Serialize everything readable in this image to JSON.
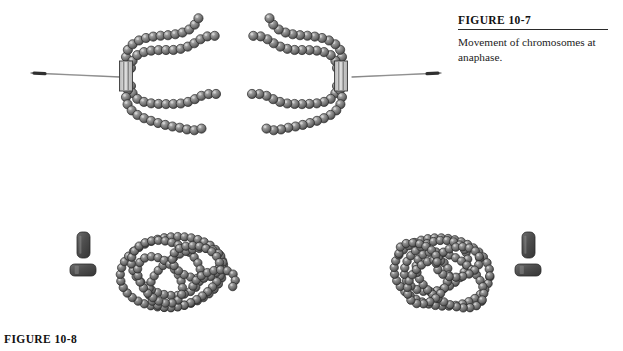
{
  "figure_top": {
    "label": "FIGURE 10-7",
    "caption": "Movement of chromosomes at anaphase."
  },
  "figure_bottom": {
    "label": "FIGURE 10-8"
  },
  "colors": {
    "background": "#ffffff",
    "bead_fill": "#7d7d7d",
    "bead_fill_light": "#a8a8a8",
    "bead_fill_dark": "#4a4a4a",
    "bead_outline": "#2b2b2b",
    "bead_highlight": "#d9d9d9",
    "spindle_fiber": "#8c8c8c",
    "spindle_fiber_tip": "#303030",
    "centromere_fill": "#c9c9c9",
    "centromere_stroke": "#3a3a3a",
    "centriole_fill": "#555555",
    "centriole_stroke": "#2a2a2a",
    "text": "#111111",
    "rule": "#2a2a2a"
  },
  "geometry": {
    "canvas": {
      "width": 623,
      "height": 351
    },
    "bead_radius": 4.6,
    "bead_spacing": 7.4,
    "chromatin_bead_radius": 4.2,
    "chromatin_bead_spacing": 6.8
  },
  "anaphase_scene": {
    "name": "anaphase-chromosomes",
    "left_chromosome": {
      "name": "left-chromosome",
      "centromere": {
        "x": 126,
        "y": 76,
        "width": 13,
        "height": 30,
        "bars": 3
      },
      "arms": [
        {
          "name": "upper-outer-arm",
          "points": [
            [
              128,
              64
            ],
            [
              126,
              56
            ],
            [
              129,
              48
            ],
            [
              136,
              42
            ],
            [
              146,
              38
            ],
            [
              158,
              36
            ],
            [
              170,
              35
            ],
            [
              181,
              33
            ],
            [
              190,
              29
            ],
            [
              196,
              23
            ],
            [
              199,
              17
            ]
          ]
        },
        {
          "name": "upper-inner-arm",
          "points": [
            [
              131,
              68
            ],
            [
              133,
              60
            ],
            [
              139,
              54
            ],
            [
              149,
              51
            ],
            [
              161,
              50
            ],
            [
              173,
              50
            ],
            [
              184,
              48
            ],
            [
              193,
              44
            ],
            [
              201,
              39
            ],
            [
              209,
              36
            ],
            [
              217,
              36
            ]
          ]
        },
        {
          "name": "lower-inner-arm",
          "points": [
            [
              131,
              86
            ],
            [
              133,
              94
            ],
            [
              139,
              100
            ],
            [
              149,
              103
            ],
            [
              161,
              104
            ],
            [
              173,
              104
            ],
            [
              184,
              103
            ],
            [
              193,
              100
            ],
            [
              201,
              96
            ],
            [
              209,
              94
            ],
            [
              217,
              94
            ]
          ]
        },
        {
          "name": "lower-outer-arm",
          "points": [
            [
              128,
              90
            ],
            [
              126,
              98
            ],
            [
              129,
              107
            ],
            [
              136,
              114
            ],
            [
              146,
              119
            ],
            [
              158,
              123
            ],
            [
              170,
              126
            ],
            [
              181,
              128
            ],
            [
              190,
              130
            ],
            [
              197,
              130
            ],
            [
              203,
              128
            ]
          ]
        }
      ],
      "spindle_fiber": {
        "name": "left-spindle-fiber",
        "from": [
          31,
          73
        ],
        "to": [
          120,
          77
        ],
        "tip_at": "from"
      }
    },
    "right_chromosome": {
      "name": "right-chromosome",
      "centromere": {
        "x": 341,
        "y": 76,
        "width": 13,
        "height": 30,
        "bars": 3
      },
      "arms": [
        {
          "name": "upper-outer-arm",
          "points": [
            [
              340,
              64
            ],
            [
              342,
              56
            ],
            [
              339,
              48
            ],
            [
              332,
              42
            ],
            [
              322,
              38
            ],
            [
              310,
              36
            ],
            [
              298,
              35
            ],
            [
              287,
              33
            ],
            [
              278,
              29
            ],
            [
              272,
              23
            ],
            [
              269,
              17
            ]
          ]
        },
        {
          "name": "upper-inner-arm",
          "points": [
            [
              337,
              68
            ],
            [
              335,
              60
            ],
            [
              329,
              54
            ],
            [
              319,
              51
            ],
            [
              307,
              50
            ],
            [
              295,
              50
            ],
            [
              284,
              48
            ],
            [
              275,
              44
            ],
            [
              267,
              39
            ],
            [
              259,
              36
            ],
            [
              251,
              36
            ]
          ]
        },
        {
          "name": "lower-inner-arm",
          "points": [
            [
              337,
              86
            ],
            [
              335,
              94
            ],
            [
              329,
              100
            ],
            [
              319,
              103
            ],
            [
              307,
              104
            ],
            [
              295,
              104
            ],
            [
              284,
              103
            ],
            [
              275,
              100
            ],
            [
              267,
              96
            ],
            [
              259,
              94
            ],
            [
              251,
              94
            ]
          ]
        },
        {
          "name": "lower-outer-arm",
          "points": [
            [
              340,
              90
            ],
            [
              342,
              98
            ],
            [
              339,
              107
            ],
            [
              332,
              114
            ],
            [
              322,
              119
            ],
            [
              310,
              123
            ],
            [
              298,
              126
            ],
            [
              287,
              128
            ],
            [
              278,
              130
            ],
            [
              271,
              130
            ],
            [
              265,
              128
            ]
          ]
        }
      ],
      "spindle_fiber": {
        "name": "right-spindle-fiber",
        "from": [
          441,
          73
        ],
        "to": [
          352,
          77
        ],
        "tip_at": "from"
      }
    }
  },
  "telophase_scene": {
    "name": "telophase-chromatin",
    "left_chromatin": {
      "name": "left-chromatin-mass",
      "center": [
        175,
        272
      ],
      "loops": [
        {
          "name": "chromatin-loop-1",
          "cx": 172,
          "cy": 272,
          "rx": 52,
          "ry": 35,
          "rot": -8,
          "start": 0,
          "sweep": 360
        },
        {
          "name": "chromatin-loop-2",
          "cx": 166,
          "cy": 268,
          "rx": 36,
          "ry": 26,
          "rot": 22,
          "start": 0,
          "sweep": 360
        },
        {
          "name": "chromatin-loop-3",
          "cx": 186,
          "cy": 278,
          "rx": 41,
          "ry": 24,
          "rot": -32,
          "start": 0,
          "sweep": 360
        },
        {
          "name": "chromatin-loop-4",
          "cx": 160,
          "cy": 280,
          "rx": 27,
          "ry": 18,
          "rot": 48,
          "start": 0,
          "sweep": 360
        },
        {
          "name": "chromatin-loop-5",
          "cx": 196,
          "cy": 262,
          "rx": 24,
          "ry": 16,
          "rot": 12,
          "start": 0,
          "sweep": 360
        },
        {
          "name": "chromatin-tail-1",
          "cx": 214,
          "cy": 284,
          "rx": 22,
          "ry": 13,
          "rot": -18,
          "start": 200,
          "sweep": 200
        }
      ]
    },
    "right_chromatin": {
      "name": "right-chromatin-mass",
      "center": [
        442,
        272
      ],
      "loops": [
        {
          "name": "chromatin-loop-1",
          "cx": 442,
          "cy": 272,
          "rx": 48,
          "ry": 34,
          "rot": 6,
          "start": 0,
          "sweep": 360
        },
        {
          "name": "chromatin-loop-2",
          "cx": 436,
          "cy": 266,
          "rx": 33,
          "ry": 24,
          "rot": -24,
          "start": 0,
          "sweep": 360
        },
        {
          "name": "chromatin-loop-3",
          "cx": 450,
          "cy": 280,
          "rx": 38,
          "ry": 22,
          "rot": 34,
          "start": 0,
          "sweep": 360
        },
        {
          "name": "chromatin-loop-4",
          "cx": 428,
          "cy": 282,
          "rx": 25,
          "ry": 17,
          "rot": -50,
          "start": 0,
          "sweep": 360
        },
        {
          "name": "chromatin-loop-5",
          "cx": 458,
          "cy": 262,
          "rx": 22,
          "ry": 15,
          "rot": -10,
          "start": 0,
          "sweep": 360
        },
        {
          "name": "chromatin-tail-1",
          "cx": 418,
          "cy": 256,
          "rx": 20,
          "ry": 12,
          "rot": 20,
          "start": 160,
          "sweep": 210
        }
      ]
    },
    "left_centriole_pair": {
      "name": "left-centriole-pair",
      "vertical": {
        "x": 77,
        "y": 232,
        "width": 13,
        "height": 26
      },
      "horizontal": {
        "x": 70,
        "y": 264,
        "width": 26,
        "height": 12
      }
    },
    "right_centriole_pair": {
      "name": "right-centriole-pair",
      "vertical": {
        "x": 522,
        "y": 232,
        "width": 13,
        "height": 26
      },
      "horizontal": {
        "x": 515,
        "y": 264,
        "width": 26,
        "height": 12
      }
    }
  }
}
